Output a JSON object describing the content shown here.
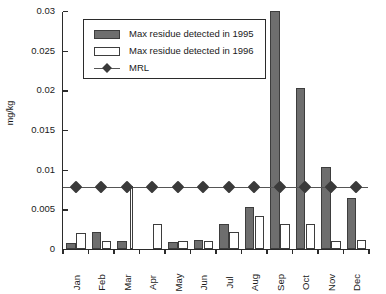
{
  "chart_data": {
    "type": "bar",
    "title": "",
    "xlabel": "",
    "ylabel": "mg/kg",
    "ylim": [
      0,
      0.03
    ],
    "yticks": [
      "0",
      "0.005",
      "0.01",
      "0.015",
      "0.02",
      "0.025",
      "0.03"
    ],
    "ytick_values": [
      0,
      0.005,
      0.01,
      0.015,
      0.02,
      0.025,
      0.03
    ],
    "grid": false,
    "legend_position": "top-left-inside",
    "categories": [
      "Jan",
      "Feb",
      "Mar",
      "Apr",
      "May",
      "Jun",
      "Jul",
      "Aug",
      "Sep",
      "Oct",
      "Nov",
      "Dec"
    ],
    "series": [
      {
        "name": "Max residue detected in 1995",
        "type": "bar",
        "color": "#6e6e6e",
        "values": [
          0.0007,
          0.0021,
          0.001,
          0,
          0.0009,
          0.0011,
          0.0032,
          0.0053,
          0.03,
          0.0203,
          0.0104,
          0.0064
        ],
        "notes": "Sep bar is clipped at the top of the axis (value exceeds 0.03)"
      },
      {
        "name": "Max residue detected in 1996",
        "type": "bar",
        "color": "#ffffff",
        "values": [
          0.002,
          0.001,
          0.008,
          0.0031,
          0.001,
          0.001,
          0.0021,
          0.0042,
          0.0032,
          0.0032,
          0.001,
          0.0011
        ],
        "notes": "Mar bar is a very narrow sliver reaching 0.008"
      },
      {
        "name": "MRL",
        "type": "line",
        "color": "#3a3a3a",
        "marker": "diamond",
        "values": [
          0.008,
          0.008,
          0.008,
          0.008,
          0.008,
          0.008,
          0.008,
          0.008,
          0.008,
          0.008,
          0.008,
          0.008
        ]
      }
    ]
  },
  "legend": {
    "items": [
      {
        "label": "Max residue detected in 1995",
        "swatch": "filled-gray-rect"
      },
      {
        "label": "Max residue detected in 1996",
        "swatch": "open-white-rect"
      },
      {
        "label": "MRL",
        "swatch": "line-with-diamond-marker"
      }
    ]
  }
}
